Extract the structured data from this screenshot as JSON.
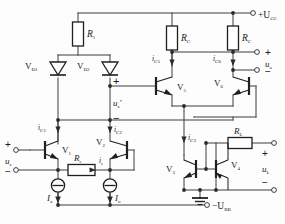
{
  "diagram": {
    "type": "schematic",
    "title_visible": false,
    "colors": {
      "wire": "#3d3d3d",
      "component_outline": "#1f1f1f",
      "component_fill": "#ffffff",
      "label_text": "#1a1a1a",
      "background": "#fdfdfd"
    },
    "power_rails": {
      "positive": {
        "label": "+U",
        "subscript": "CC"
      },
      "negative": {
        "label": "−U",
        "subscript": "BB"
      },
      "ground": {
        "label": ""
      }
    },
    "resistors": [
      {
        "id": "R1",
        "label": "R",
        "subscript": "1",
        "orientation": "vertical"
      },
      {
        "id": "RC_left",
        "label": "R",
        "subscript": "C",
        "orientation": "vertical"
      },
      {
        "id": "RC_right",
        "label": "R",
        "subscript": "C",
        "orientation": "vertical"
      },
      {
        "id": "Re",
        "label": "R",
        "subscript": "e",
        "orientation": "horizontal"
      },
      {
        "id": "RL",
        "label": "R",
        "subscript": "L",
        "orientation": "horizontal"
      }
    ],
    "diodes": [
      {
        "id": "VD1",
        "label": "V",
        "subscript": "D1"
      },
      {
        "id": "VD2",
        "label": "V",
        "subscript": "D2"
      }
    ],
    "transistors": [
      {
        "id": "V1",
        "label": "V",
        "subscript": "1",
        "type": "npn"
      },
      {
        "id": "V2",
        "label": "V",
        "subscript": "2",
        "type": "npn"
      },
      {
        "id": "V3",
        "label": "V",
        "subscript": "3",
        "type": "npn"
      },
      {
        "id": "V4",
        "label": "V",
        "subscript": "4",
        "type": "pnp"
      },
      {
        "id": "V5",
        "label": "V",
        "subscript": "5",
        "type": "npn"
      },
      {
        "id": "V6",
        "label": "V",
        "subscript": "6",
        "type": "npn"
      }
    ],
    "current_sources": [
      {
        "id": "Io_left",
        "label": "I",
        "subscript": "o"
      },
      {
        "id": "Io_right",
        "label": "I",
        "subscript": "o"
      }
    ],
    "currents": [
      {
        "id": "iC1",
        "label": "i",
        "subscript": "C1"
      },
      {
        "id": "iC2",
        "label": "i",
        "subscript": "C2"
      },
      {
        "id": "iC3",
        "label": "i",
        "subscript": "C3"
      },
      {
        "id": "iC5",
        "label": "i",
        "subscript": "C5"
      },
      {
        "id": "iC6",
        "label": "i",
        "subscript": "C6"
      },
      {
        "id": "ie",
        "label": "i",
        "subscript": "e"
      }
    ],
    "voltages": [
      {
        "id": "us",
        "label": "u",
        "subscript": "s",
        "prime": false,
        "plus": "+",
        "minus": "−"
      },
      {
        "id": "us_prime",
        "label": "u",
        "subscript": "s",
        "prime": true,
        "plus": "+",
        "minus": "−"
      },
      {
        "id": "uo",
        "label": "u",
        "subscript": "o",
        "prime": false,
        "plus": "+",
        "minus": "−"
      },
      {
        "id": "uL",
        "label": "u",
        "subscript": "L",
        "prime": false,
        "plus": "+",
        "minus": "−"
      }
    ]
  }
}
